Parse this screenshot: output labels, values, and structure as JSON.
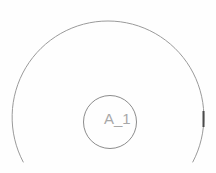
{
  "drawing": {
    "label": "A_1",
    "label_color": "#a8a8a8",
    "outer_circle_stroke": "#9a9a9a",
    "inner_circle_stroke": "#8c8c8c",
    "marker_color": "#4a4a4a"
  }
}
